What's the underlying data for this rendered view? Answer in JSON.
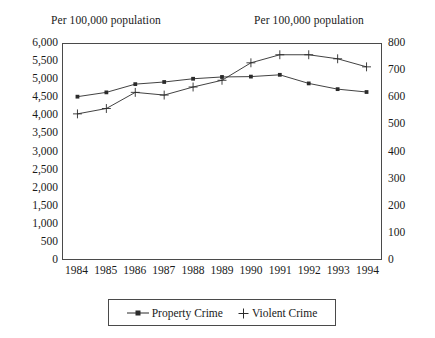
{
  "axis_titles": {
    "left": "Per 100,000 population",
    "right": "Per 100,000 population"
  },
  "legend": {
    "property_label": "Property Crime",
    "violent_label": "Violent Crime",
    "property_marker": "square-line-marker",
    "violent_marker": "plus-marker"
  },
  "colors": {
    "line": "#2b2b2b",
    "axis": "#4a4a4a",
    "text": "#1a1a1a",
    "background": "#ffffff"
  },
  "chart_data": {
    "type": "line",
    "title": "",
    "xlabel": "",
    "ylabel": "Per 100,000 population",
    "y2label": "Per 100,000 population",
    "categories": [
      "1984",
      "1985",
      "1986",
      "1987",
      "1988",
      "1989",
      "1990",
      "1991",
      "1992",
      "1993",
      "1994"
    ],
    "x_tick_labels": [
      "1984",
      "1985",
      "1986",
      "1987",
      "1988",
      "1989",
      "1990",
      "1991",
      "1992",
      "1993",
      "1994"
    ],
    "y_tick_labels": [
      "0",
      "500",
      "1,000",
      "1,500",
      "2,000",
      "2,500",
      "3,000",
      "3,500",
      "4,000",
      "4,500",
      "5,000",
      "5,500",
      "6,000"
    ],
    "y2_tick_labels": [
      "0",
      "100",
      "200",
      "300",
      "400",
      "500",
      "600",
      "700",
      "800"
    ],
    "ylim": [
      0,
      6000
    ],
    "y2lim": [
      0,
      800
    ],
    "grid": false,
    "legend_position": "bottom",
    "series": [
      {
        "name": "Property Crime",
        "axis": "left",
        "marker": "square",
        "values": [
          4530,
          4650,
          4880,
          4940,
          5030,
          5080,
          5090,
          5140,
          4900,
          4740,
          4660
        ]
      },
      {
        "name": "Violent Crime",
        "axis": "right",
        "marker": "plus",
        "values": [
          540,
          560,
          620,
          610,
          640,
          665,
          730,
          760,
          760,
          745,
          715
        ]
      }
    ]
  }
}
